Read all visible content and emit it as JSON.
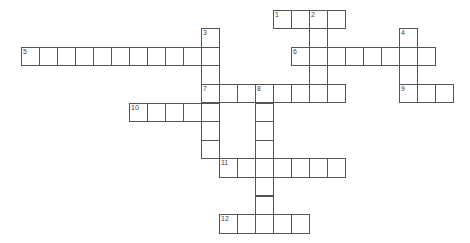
{
  "puzzle": {
    "type": "crossword",
    "grid_origin": {
      "x": 201,
      "y": 9.5
    },
    "cell_pitch": {
      "x": 18,
      "y": 18.6
    },
    "colors": {
      "border": "#555555",
      "background": "#ffffff",
      "number": "#444444"
    },
    "entries": [
      {
        "number": "1",
        "direction": "across",
        "row": 0,
        "col": 4,
        "length": 4
      },
      {
        "number": "2",
        "direction": "down",
        "row": 0,
        "col": 6,
        "length": 5
      },
      {
        "number": "3",
        "direction": "down",
        "row": 1,
        "col": 0,
        "length": 7
      },
      {
        "number": "4",
        "direction": "down",
        "row": 1,
        "col": 11,
        "length": 4
      },
      {
        "number": "5",
        "direction": "across",
        "row": 2,
        "col": -10,
        "length": 11
      },
      {
        "number": "6",
        "direction": "across",
        "row": 2,
        "col": 5,
        "length": 8
      },
      {
        "number": "7",
        "direction": "across",
        "row": 4,
        "col": 0,
        "length": 8
      },
      {
        "number": "8",
        "direction": "down",
        "row": 4,
        "col": 3,
        "length": 8
      },
      {
        "number": "9",
        "direction": "across",
        "row": 4,
        "col": 11,
        "length": 3
      },
      {
        "number": "10",
        "direction": "across",
        "row": 5,
        "col": -4,
        "length": 5
      },
      {
        "number": "11",
        "direction": "across",
        "row": 8,
        "col": 1,
        "length": 7
      },
      {
        "number": "12",
        "direction": "across",
        "row": 11,
        "col": 1,
        "length": 5
      }
    ]
  }
}
